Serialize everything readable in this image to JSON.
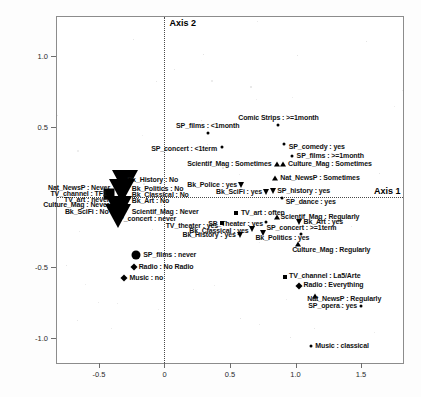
{
  "chart_data": {
    "type": "scatter",
    "title": "",
    "xlabel": "Axis 1",
    "ylabel": "Axis 2",
    "xlim": [
      -0.82,
      1.82
    ],
    "ylim": [
      -1.18,
      1.28
    ],
    "xticks": [
      "-0.5",
      "0",
      "0.5",
      "1.0",
      "1.5"
    ],
    "xtickvals": [
      -0.5,
      0,
      0.5,
      1.0,
      1.5
    ],
    "yticks": [
      "1.0",
      "0.5",
      "-0.5",
      "-1.0"
    ],
    "ytickvals": [
      1.0,
      0.5,
      -0.5,
      -1.0
    ],
    "grid": false,
    "legend": "none",
    "reference_lines": {
      "vertical_x": 0,
      "horizontal_y": 0
    },
    "points": [
      {
        "label": "SP_films : <1month",
        "x": 0.33,
        "y": 0.455,
        "marker": "dot",
        "anchor": "c",
        "dx": 0,
        "dy": -7
      },
      {
        "label": "Comic Strips : >=1month",
        "x": 0.87,
        "y": 0.515,
        "marker": "dot",
        "anchor": "c",
        "dx": 0,
        "dy": -7
      },
      {
        "label": "SP_concert : <1term",
        "x": 0.44,
        "y": 0.355,
        "marker": "dot",
        "anchor": "r",
        "dx": -5,
        "dy": 2
      },
      {
        "label": "SP_comedy : yes",
        "x": 0.91,
        "y": 0.375,
        "marker": "dot",
        "anchor": "l",
        "dx": 5,
        "dy": 3
      },
      {
        "label": "SP_films : >=1month",
        "x": 0.97,
        "y": 0.295,
        "marker": "dot",
        "anchor": "l",
        "dx": 5,
        "dy": 0
      },
      {
        "label": "Scientif_Mag : Sometimes",
        "x": 0.855,
        "y": 0.235,
        "marker": "tri-up",
        "anchor": "r",
        "dx": -5,
        "dy": 0
      },
      {
        "label": "Culture_Mag : Sometimes",
        "x": 0.905,
        "y": 0.235,
        "marker": "tri-up",
        "anchor": "l",
        "dx": 5,
        "dy": 0
      },
      {
        "label": "Nat_NewsP : Sometimes",
        "x": 0.845,
        "y": 0.135,
        "marker": "tri-up",
        "anchor": "l",
        "dx": 5,
        "dy": 0
      },
      {
        "label": "Bk_Police : yes",
        "x": 0.585,
        "y": 0.085,
        "marker": "tri-dn",
        "anchor": "r",
        "dx": -4,
        "dy": 0
      },
      {
        "label": "SP_history : yes",
        "x": 0.83,
        "y": 0.045,
        "marker": "tri-dn",
        "anchor": "l",
        "dx": 4,
        "dy": 0
      },
      {
        "label": "Bk_SciFi : yes",
        "x": 0.775,
        "y": 0.035,
        "marker": "tri-dn",
        "anchor": "r",
        "dx": -4,
        "dy": 0
      },
      {
        "label": "SP_dance : yes",
        "x": 0.895,
        "y": -0.01,
        "marker": "dot",
        "anchor": "l",
        "dx": 4,
        "dy": 4
      },
      {
        "label": "Bk_History : No",
        "x": -0.3,
        "y": 0.105,
        "marker": "tri-dn-lg",
        "anchor": "l",
        "dx": 2,
        "dy": -2
      },
      {
        "label": "Bk_Politics : No",
        "x": -0.265,
        "y": 0.055,
        "marker": "none",
        "anchor": "l",
        "dx": 2,
        "dy": 0
      },
      {
        "label": "Bk_Classical : No",
        "x": -0.265,
        "y": 0.015,
        "marker": "none",
        "anchor": "l",
        "dx": 2,
        "dy": 0
      },
      {
        "label": "Bk_Art : No",
        "x": -0.265,
        "y": -0.03,
        "marker": "none",
        "anchor": "l",
        "dx": 2,
        "dy": 0
      },
      {
        "label": "Nat_NewsP : Never",
        "x": -0.4,
        "y": 0.065,
        "marker": "none",
        "anchor": "r",
        "dx": -2,
        "dy": 0
      },
      {
        "label": "TV_channel : TF1",
        "x": -0.425,
        "y": 0.025,
        "marker": "sq-lg",
        "anchor": "r",
        "dx": -2,
        "dy": 0
      },
      {
        "label": "TV_art : never",
        "x": -0.405,
        "y": -0.02,
        "marker": "none",
        "anchor": "r",
        "dx": -2,
        "dy": 0
      },
      {
        "label": "Culture_Mag : Never",
        "x": -0.405,
        "y": -0.06,
        "marker": "none",
        "anchor": "r",
        "dx": -2,
        "dy": 0
      },
      {
        "label": "Bk_SciFi : No",
        "x": -0.41,
        "y": -0.105,
        "marker": "none",
        "anchor": "r",
        "dx": -2,
        "dy": 0
      },
      {
        "label": "Scientif_Mag : Never",
        "x": -0.265,
        "y": -0.105,
        "marker": "none",
        "anchor": "l",
        "dx": 2,
        "dy": 0
      },
      {
        "label": "SP_concert : never",
        "x": -0.32,
        "y": -0.155,
        "marker": "none",
        "anchor": "l",
        "dx": -8,
        "dy": 0
      },
      {
        "label": "TV_art : often",
        "x": 0.545,
        "y": -0.115,
        "marker": "sq",
        "anchor": "l",
        "dx": 5,
        "dy": 0
      },
      {
        "label": "Scientif_Mag : Regularly",
        "x": 0.855,
        "y": -0.145,
        "marker": "tri-up",
        "anchor": "l",
        "dx": 4,
        "dy": 0
      },
      {
        "label": "SP_Theater : yes",
        "x": 0.775,
        "y": -0.175,
        "marker": "dot",
        "anchor": "r",
        "dx": -3,
        "dy": 2
      },
      {
        "label": "Bk_Art : yes",
        "x": 1.03,
        "y": -0.175,
        "marker": "tri-dn",
        "anchor": "l",
        "dx": 4,
        "dy": 0
      },
      {
        "label": "TV_theater : yes",
        "x": 0.44,
        "y": -0.185,
        "marker": "sq",
        "anchor": "r",
        "dx": -4,
        "dy": 3
      },
      {
        "label": "Bk_Classical : yes",
        "x": 0.665,
        "y": -0.225,
        "marker": "tri-dn",
        "anchor": "r",
        "dx": -3,
        "dy": 2
      },
      {
        "label": "SP_concert : >=1term",
        "x": 1.045,
        "y": -0.26,
        "marker": "dot",
        "anchor": "c",
        "dx": 0,
        "dy": -6
      },
      {
        "label": "Bk_Politics : yes",
        "x": 0.755,
        "y": -0.255,
        "marker": "tri-dn",
        "anchor": "l",
        "dx": -8,
        "dy": 5
      },
      {
        "label": "Bk_History : yes",
        "x": 0.575,
        "y": -0.27,
        "marker": "tri-dn",
        "anchor": "r",
        "dx": -4,
        "dy": 0
      },
      {
        "label": "Culture_Mag : Regularly",
        "x": 1.02,
        "y": -0.335,
        "marker": "tri-up",
        "anchor": "l",
        "dx": -6,
        "dy": 6
      },
      {
        "label": "TV_channel : La5/Arte",
        "x": 0.92,
        "y": -0.565,
        "marker": "sq",
        "anchor": "l",
        "dx": 4,
        "dy": -1
      },
      {
        "label": "Radio : Everything",
        "x": 1.03,
        "y": -0.635,
        "marker": "diamond",
        "anchor": "l",
        "dx": 4,
        "dy": -1
      },
      {
        "label": "Nat_NewsP : Regularly",
        "x": 1.15,
        "y": -0.705,
        "marker": "tri-up",
        "anchor": "l",
        "dx": -8,
        "dy": 3
      },
      {
        "label": "SP_opera : yes",
        "x": 1.5,
        "y": -0.775,
        "marker": "dot",
        "anchor": "r",
        "dx": -4,
        "dy": 0
      },
      {
        "label": "Music : classical",
        "x": 1.12,
        "y": -1.06,
        "marker": "dot",
        "anchor": "l",
        "dx": 4,
        "dy": 0
      },
      {
        "label": "SP_films : never",
        "x": -0.215,
        "y": -0.415,
        "marker": "dot-lg",
        "anchor": "l",
        "dx": 7,
        "dy": 0
      },
      {
        "label": "Radio : No Radio",
        "x": -0.235,
        "y": -0.5,
        "marker": "diamond",
        "anchor": "l",
        "dx": 5,
        "dy": 0
      },
      {
        "label": "Music : no",
        "x": -0.305,
        "y": -0.575,
        "marker": "diamond",
        "anchor": "l",
        "dx": 5,
        "dy": 0
      }
    ]
  },
  "axis_labels": {
    "axis1": "Axis 1",
    "axis2": "Axis 2"
  }
}
